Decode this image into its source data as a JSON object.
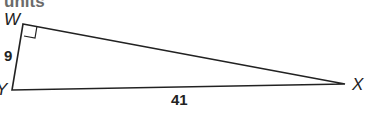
{
  "header": {
    "partial_text": "units"
  },
  "triangle": {
    "vertices": {
      "W": "W",
      "X": "X",
      "Y": "Y"
    },
    "right_angle_at": "W",
    "sides": {
      "WY": "9",
      "YX": "41"
    }
  },
  "colors": {
    "stroke": "#222222",
    "header_text": "#6b6b6b"
  }
}
